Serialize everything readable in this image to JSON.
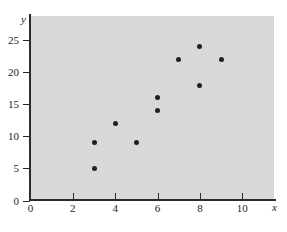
{
  "chart_data": {
    "type": "scatter",
    "title": "",
    "xlabel": "x",
    "ylabel": "y",
    "xlim": [
      0,
      11.5
    ],
    "ylim": [
      0,
      27.5
    ],
    "xticks": [
      0,
      2,
      4,
      6,
      8,
      10
    ],
    "yticks": [
      0,
      5,
      10,
      15,
      20,
      25
    ],
    "grid": false,
    "legend": null,
    "plot_background_color": "#d8d8d8",
    "point_color": "#231f20",
    "axis_color": "#2b2b2b",
    "points": [
      {
        "x": 3,
        "y": 5
      },
      {
        "x": 3,
        "y": 9
      },
      {
        "x": 4,
        "y": 12
      },
      {
        "x": 5,
        "y": 9
      },
      {
        "x": 6,
        "y": 14
      },
      {
        "x": 6,
        "y": 16
      },
      {
        "x": 7,
        "y": 22
      },
      {
        "x": 8,
        "y": 18
      },
      {
        "x": 8,
        "y": 24
      },
      {
        "x": 9,
        "y": 22
      }
    ]
  }
}
